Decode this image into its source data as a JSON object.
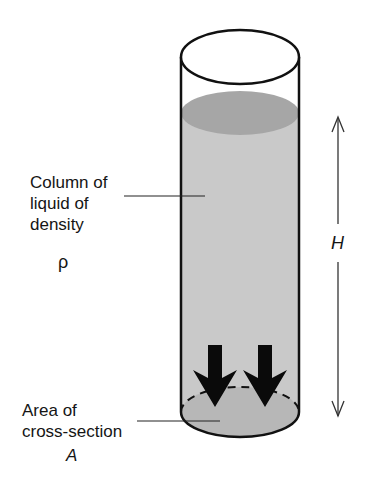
{
  "diagram": {
    "labels": {
      "column": [
        "Column of",
        "liquid of",
        "density"
      ],
      "density_symbol": "ρ",
      "area": [
        "Area of",
        "cross-section"
      ],
      "area_symbol": "A",
      "height_symbol": "H"
    },
    "colors": {
      "outline": "#111111",
      "liquid": "#c9c9c9",
      "liquid_surface": "#a8a8a8",
      "base_area": "#b5b5b5",
      "arrow": "#0a0a0a",
      "dimension_line": "#333333"
    },
    "elements": [
      "cylinder",
      "liquid-column",
      "liquid-surface",
      "cross-section-area",
      "force-arrows",
      "height-dimension"
    ]
  }
}
